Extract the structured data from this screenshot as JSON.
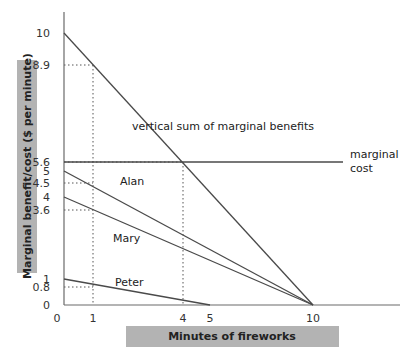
{
  "chart_data": {
    "type": "line",
    "title": "",
    "xlabel": "Minutes of fireworks",
    "ylabel": "Marginal benefit/cost ($ per minute)",
    "xlim": [
      0,
      11.5
    ],
    "ylim": [
      0,
      10.7
    ],
    "grid": false,
    "x_ticks": [
      0,
      1,
      4,
      5,
      10
    ],
    "y_ticks": [
      0,
      0.8,
      1,
      3.6,
      4,
      4.5,
      5,
      5.6,
      8.9,
      10
    ],
    "series": [
      {
        "name": "vertical sum of marginal benefits",
        "label": "vertical sum of marginal benefits",
        "x": [
          0,
          10
        ],
        "y": [
          10,
          0
        ]
      },
      {
        "name": "marginal cost",
        "label": "marginal\ncost",
        "x": [
          0,
          11.2
        ],
        "y": [
          5.6,
          5.6
        ]
      },
      {
        "name": "Alan",
        "label": "Alan",
        "x": [
          0,
          10
        ],
        "y": [
          5,
          0
        ]
      },
      {
        "name": "Mary",
        "label": "Mary",
        "x": [
          0,
          10
        ],
        "y": [
          4,
          0
        ]
      },
      {
        "name": "Peter",
        "label": "Peter",
        "x": [
          0,
          5
        ],
        "y": [
          1,
          0
        ]
      }
    ],
    "annotations": [
      {
        "type": "dotted-guide",
        "at_x": 1,
        "values_y": [
          8.9,
          4.5,
          3.6,
          0.8
        ]
      },
      {
        "type": "dotted-guide",
        "at_x": 4,
        "values_y": [
          5.6
        ]
      }
    ]
  },
  "layout": {
    "x_px": {
      "0": 64,
      "1": 93,
      "4": 183,
      "5": 210,
      "10": 313,
      "11.2": 343,
      "11.5": 400
    },
    "y_px": {
      "0": 305,
      "0.8": 287,
      "1": 279,
      "3.6": 210,
      "4": 197,
      "4.5": 183,
      "5": 171,
      "5.6": 162,
      "8.9": 65,
      "10": 33,
      "10.7": 12
    }
  },
  "labels": {
    "ylabel": "Marginal benefit/cost ($ per minute)",
    "xlabel": "Minutes of fireworks",
    "vsum": "vertical sum of marginal benefits",
    "mc_line1": "marginal",
    "mc_line2": "cost",
    "alan": "Alan",
    "mary": "Mary",
    "peter": "Peter"
  }
}
